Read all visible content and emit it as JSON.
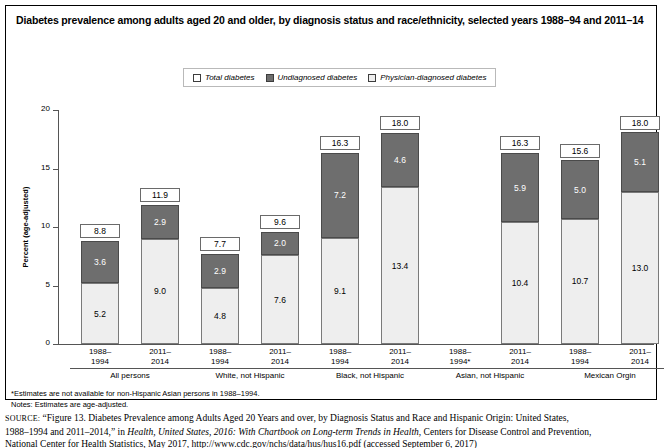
{
  "title": "Diabetes prevalence among adults aged 20 and older, by diagnosis status and race/ethnicity, selected years 1988–94 and 2011–14",
  "legend": {
    "items": [
      {
        "label": "Total diabetes",
        "swatch": "white",
        "color": "#ffffff"
      },
      {
        "label": "Undiagnosed diabetes",
        "swatch": "dark",
        "color": "#6e6e6e"
      },
      {
        "label": "Physician-diagnosed diabetes",
        "swatch": "light",
        "color": "#eeeeee"
      }
    ]
  },
  "footnotes": {
    "asterisk": "*Estimates are not available for non-Hispanic Asian persons in 1988–1994.",
    "notes": "Notes: Estimates are age-adjusted."
  },
  "source": {
    "label": "SOURCE:",
    "line1": "“Figure 13. Diabetes Prevalence among Adults Aged 20 Years and over, by Diagnosis Status and Race and Hispanic Origin: United States,",
    "line2_pre": "1988–1994 and 2011–2014,” in ",
    "line2_italic": "Health, United States, 2016: With Chartbook on Long-term Trends in Health",
    "line2_post": ", Centers for Disease Control and Prevention,",
    "line3": "National Center for Health Statistics, May 2017, http://www.cdc.gov/nchs/data/hus/hus16.pdf (accessed September 6, 2017)"
  },
  "chart_data": {
    "type": "bar",
    "title": "Diabetes prevalence among adults aged 20 and older, by diagnosis status and race/ethnicity, selected years 1988–94 and 2011–14",
    "xlabel": "",
    "ylabel": "Percent (age-adjusted)",
    "ylim": [
      0,
      20
    ],
    "yticks": [
      0,
      5,
      10,
      15,
      20
    ],
    "ytick_labels": [
      "0",
      "5",
      "10",
      "15",
      "20"
    ],
    "grid": false,
    "legend_position": "top-center",
    "stacked": true,
    "series": [
      {
        "name": "Physician-diagnosed diabetes",
        "color": "#eeeeee"
      },
      {
        "name": "Undiagnosed diabetes",
        "color": "#6e6e6e"
      }
    ],
    "groups": [
      {
        "name": "All persons",
        "bars": [
          {
            "period": "1988–",
            "period2": "1994",
            "total": 8.8,
            "undiagnosed": 3.6,
            "physician_diagnosed": 5.2,
            "available": true
          },
          {
            "period": "2011–",
            "period2": "2014",
            "total": 11.9,
            "undiagnosed": 2.9,
            "physician_diagnosed": 9.0,
            "available": true
          }
        ]
      },
      {
        "name": "White, not Hispanic",
        "bars": [
          {
            "period": "1988–",
            "period2": "1994",
            "total": 7.7,
            "undiagnosed": 2.9,
            "physician_diagnosed": 4.8,
            "available": true
          },
          {
            "period": "2011–",
            "period2": "2014",
            "total": 9.6,
            "undiagnosed": 2.0,
            "physician_diagnosed": 7.6,
            "available": true
          }
        ]
      },
      {
        "name": "Black, not Hispanic",
        "bars": [
          {
            "period": "1988–",
            "period2": "1994",
            "total": 16.3,
            "undiagnosed": 7.2,
            "physician_diagnosed": 9.1,
            "available": true
          },
          {
            "period": "2011–",
            "period2": "2014",
            "total": 18.0,
            "undiagnosed": 4.6,
            "physician_diagnosed": 13.4,
            "available": true
          }
        ]
      },
      {
        "name": "Asian, not Hispanic",
        "bars": [
          {
            "period": "1988–",
            "period2": "1994*",
            "total": null,
            "undiagnosed": null,
            "physician_diagnosed": null,
            "available": false
          },
          {
            "period": "2011–",
            "period2": "2014",
            "total": 16.3,
            "undiagnosed": 5.9,
            "physician_diagnosed": 10.4,
            "available": true
          }
        ]
      },
      {
        "name": "Mexican Orgin",
        "bars": [
          {
            "period": "1988–",
            "period2": "1994",
            "total": 15.6,
            "undiagnosed": 5.0,
            "physician_diagnosed": 10.7,
            "available": true
          },
          {
            "period": "2011–",
            "period2": "2014",
            "total": 18.0,
            "undiagnosed": 5.1,
            "physician_diagnosed": 13.0,
            "available": true
          }
        ]
      }
    ]
  }
}
